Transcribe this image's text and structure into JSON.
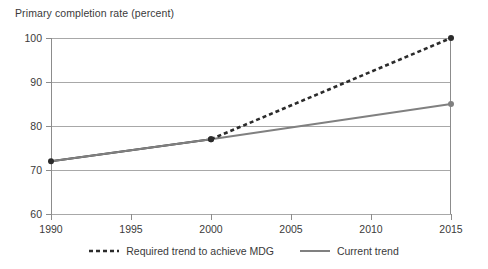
{
  "chart_data": {
    "type": "line",
    "title": "Primary completion rate (percent)",
    "xlabel": "",
    "ylabel": "",
    "xlim": [
      1990,
      2015
    ],
    "ylim": [
      60,
      100
    ],
    "yticks": [
      60,
      70,
      80,
      90,
      100
    ],
    "xticks": [
      1990,
      1995,
      2000,
      2005,
      2010,
      2015
    ],
    "grid": true,
    "legend_position": "bottom",
    "series": [
      {
        "name": "Required trend to achieve MDG",
        "style": "dashed",
        "color": "#2b2b2b",
        "x": [
          2000,
          2015
        ],
        "values": [
          77,
          100
        ],
        "markers": [
          {
            "x": 2000,
            "y": 77
          },
          {
            "x": 2015,
            "y": 100
          }
        ]
      },
      {
        "name": "Current trend",
        "style": "solid",
        "color": "#808080",
        "x": [
          1990,
          2000,
          2015
        ],
        "values": [
          72,
          77,
          85
        ],
        "markers": [
          {
            "x": 1990,
            "y": 72
          },
          {
            "x": 2000,
            "y": 77
          },
          {
            "x": 2015,
            "y": 85
          }
        ]
      }
    ],
    "historical_segment": {
      "name": "1990 to 2000 observed",
      "color": "#2b2b2b",
      "x": [
        1990,
        2000
      ],
      "values": [
        72,
        77
      ]
    }
  },
  "legend": {
    "entries": [
      {
        "label": "Required trend to achieve MDG",
        "style": "dashed",
        "color": "#2b2b2b"
      },
      {
        "label": "Current trend",
        "style": "solid",
        "color": "#808080"
      }
    ]
  },
  "axis": {
    "y_tick_labels": [
      "100",
      "90",
      "80",
      "70",
      "60"
    ],
    "x_tick_labels": [
      "1990",
      "1995",
      "2000",
      "2005",
      "2010",
      "2015"
    ]
  }
}
